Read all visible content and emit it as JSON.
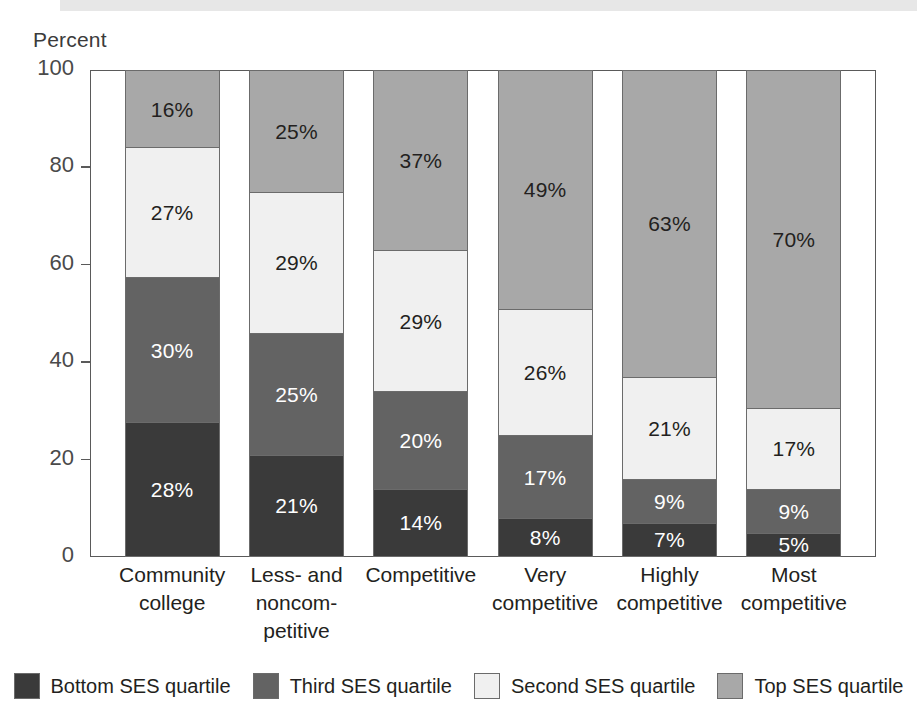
{
  "axis_title": "Percent",
  "chart_data": {
    "type": "bar",
    "subtype": "stacked-100",
    "title": "",
    "xlabel": "",
    "ylabel": "Percent",
    "ylim": [
      0,
      100
    ],
    "yticks": [
      0,
      20,
      40,
      60,
      80,
      100
    ],
    "ytick_labels": [
      "0",
      "20",
      "40",
      "60",
      "80",
      "100"
    ],
    "grid": false,
    "legend_position": "bottom",
    "categories": [
      "Community college",
      "Less- and noncompetitive",
      "Competitive",
      "Very competitive",
      "Highly competitive",
      "Most competitive"
    ],
    "category_label_lines": [
      [
        "Community",
        "college"
      ],
      [
        "Less- and",
        "noncom-",
        "petitive"
      ],
      [
        "Competitive"
      ],
      [
        "Very",
        "competitive"
      ],
      [
        "Highly",
        "competitive"
      ],
      [
        "Most",
        "competitive"
      ]
    ],
    "series": [
      {
        "name": "Bottom SES quartile",
        "color": "#3a3a3a",
        "label_color": "light",
        "values": [
          28,
          21,
          14,
          8,
          7,
          5
        ],
        "value_labels": [
          "28%",
          "21%",
          "14%",
          "8%",
          "7%",
          "5%"
        ]
      },
      {
        "name": "Third SES quartile",
        "color": "#636363",
        "label_color": "light",
        "values": [
          30,
          25,
          20,
          17,
          9,
          9
        ],
        "value_labels": [
          "30%",
          "25%",
          "20%",
          "17%",
          "9%",
          "9%"
        ]
      },
      {
        "name": "Second SES quartile",
        "color": "#f0f0f0",
        "label_color": "dark",
        "values": [
          27,
          29,
          29,
          26,
          21,
          17
        ],
        "value_labels": [
          "27%",
          "29%",
          "29%",
          "26%",
          "21%",
          "17%"
        ]
      },
      {
        "name": "Top SES quartile",
        "color": "#a8a8a8",
        "label_color": "dark",
        "values": [
          16,
          25,
          37,
          49,
          63,
          70
        ],
        "value_labels": [
          "16%",
          "25%",
          "37%",
          "49%",
          "63%",
          "70%"
        ]
      }
    ]
  },
  "legend": [
    {
      "label": "Bottom SES quartile",
      "color": "#3a3a3a"
    },
    {
      "label": "Third SES quartile",
      "color": "#636363"
    },
    {
      "label": "Second SES quartile",
      "color": "#f0f0f0"
    },
    {
      "label": "Top SES quartile",
      "color": "#a8a8a8"
    }
  ]
}
